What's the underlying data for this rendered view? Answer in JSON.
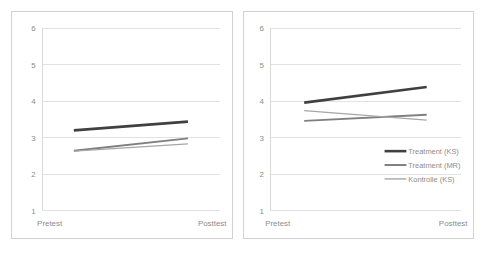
{
  "figure": {
    "background_color": "#ffffff",
    "panel_border_color": "#d2d2d2",
    "gridline_color": "#e2e2e2",
    "tick_label_color": "#8c8c8c"
  },
  "series_colors": {
    "treatment_ks": "#404040",
    "treatment_mr": "#7f7f7f",
    "kontrolle_ks": "#a6a6a6"
  },
  "legend": {
    "position": "inside-right-lower",
    "entries": [
      {
        "label": "Treatment (KS)",
        "color": "#404040",
        "width": 2.6
      },
      {
        "label": "Treatment (MR)",
        "color": "#7f7f7f",
        "width": 2.0
      },
      {
        "label": "Kontrolle (KS)",
        "color": "#a6a6a6",
        "width": 1.4
      }
    ]
  },
  "axis": {
    "y_ticks": [
      "6",
      "5",
      "4",
      "3",
      "2",
      "1"
    ],
    "y_values": [
      6,
      5,
      4,
      3,
      2,
      1
    ],
    "x_ticks": [
      "Pretest",
      "Posttest"
    ]
  },
  "chart_data": [
    {
      "type": "line",
      "panel": "left",
      "title": "",
      "xlabel": "",
      "ylabel": "",
      "categories": [
        "Pretest",
        "Posttest"
      ],
      "ylim": [
        1,
        6
      ],
      "yticks": [
        1,
        2,
        3,
        4,
        5,
        6
      ],
      "grid": true,
      "legend": false,
      "series": [
        {
          "name": "Treatment (KS)",
          "color": "#404040",
          "values": [
            3.19,
            3.43
          ]
        },
        {
          "name": "Treatment (MR)",
          "color": "#7f7f7f",
          "values": [
            2.63,
            2.97
          ]
        },
        {
          "name": "Kontrolle (KS)",
          "color": "#a6a6a6",
          "values": [
            2.62,
            2.82
          ]
        }
      ]
    },
    {
      "type": "line",
      "panel": "right",
      "title": "",
      "xlabel": "",
      "ylabel": "",
      "categories": [
        "Pretest",
        "Posttest"
      ],
      "ylim": [
        1,
        6
      ],
      "yticks": [
        1,
        2,
        3,
        4,
        5,
        6
      ],
      "grid": true,
      "legend": true,
      "series": [
        {
          "name": "Treatment (KS)",
          "color": "#404040",
          "values": [
            3.95,
            4.38
          ]
        },
        {
          "name": "Treatment (MR)",
          "color": "#7f7f7f",
          "values": [
            3.45,
            3.62
          ]
        },
        {
          "name": "Kontrolle (KS)",
          "color": "#a6a6a6",
          "values": [
            3.73,
            3.47
          ]
        }
      ]
    }
  ]
}
